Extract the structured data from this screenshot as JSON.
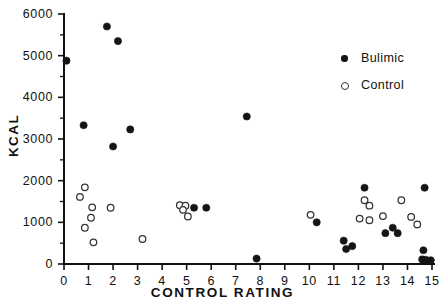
{
  "chart_data": {
    "type": "scatter",
    "title": "",
    "xlabel": "CONTROL RATING",
    "ylabel": "KCAL",
    "xlim": [
      0,
      15
    ],
    "ylim": [
      0,
      6000
    ],
    "grid": false,
    "legend_position": "top-right",
    "x_ticks": [
      0,
      1,
      2,
      3,
      4,
      5,
      6,
      7,
      8,
      9,
      10,
      11,
      12,
      13,
      14,
      15
    ],
    "x_tick_labels": [
      "0",
      "1",
      "2",
      "3",
      "4",
      "5",
      "6",
      "7",
      "8",
      "9",
      "10",
      "11",
      "12",
      "13",
      "14",
      "15"
    ],
    "y_ticks": [
      0,
      1000,
      2000,
      3000,
      4000,
      5000,
      6000
    ],
    "y_tick_labels": [
      "0",
      "1000",
      "2000",
      "3000",
      "4000",
      "5000",
      "6000"
    ],
    "y_minor_ticks": [
      500,
      1500,
      2500,
      3500,
      4500,
      5500
    ],
    "series": [
      {
        "name": "Bulimic",
        "marker": "filled-circle",
        "color": "#151515",
        "points": [
          [
            0.1,
            4880
          ],
          [
            0.8,
            3330
          ],
          [
            1.75,
            5700
          ],
          [
            2.2,
            5350
          ],
          [
            2.0,
            2820
          ],
          [
            2.7,
            3230
          ],
          [
            5.3,
            1350
          ],
          [
            5.8,
            1350
          ],
          [
            7.45,
            3540
          ],
          [
            7.85,
            130
          ],
          [
            10.3,
            1000
          ],
          [
            11.4,
            560
          ],
          [
            11.5,
            360
          ],
          [
            11.75,
            430
          ],
          [
            12.25,
            1830
          ],
          [
            13.1,
            740
          ],
          [
            13.4,
            870
          ],
          [
            13.6,
            740
          ],
          [
            14.7,
            1830
          ],
          [
            14.65,
            330
          ],
          [
            14.6,
            110
          ],
          [
            14.75,
            100
          ],
          [
            14.95,
            90
          ]
        ]
      },
      {
        "name": "Control",
        "marker": "open-circle",
        "color": "#333333",
        "points": [
          [
            0.85,
            1840
          ],
          [
            0.65,
            1610
          ],
          [
            1.15,
            1360
          ],
          [
            1.1,
            1110
          ],
          [
            0.85,
            870
          ],
          [
            1.2,
            520
          ],
          [
            1.9,
            1350
          ],
          [
            3.2,
            600
          ],
          [
            4.72,
            1410
          ],
          [
            4.95,
            1400
          ],
          [
            4.85,
            1300
          ],
          [
            5.05,
            1140
          ],
          [
            10.05,
            1180
          ],
          [
            12.25,
            1530
          ],
          [
            12.45,
            1400
          ],
          [
            12.05,
            1090
          ],
          [
            12.45,
            1050
          ],
          [
            13.0,
            1150
          ],
          [
            13.75,
            1530
          ],
          [
            14.15,
            1130
          ],
          [
            14.4,
            950
          ]
        ]
      }
    ]
  },
  "legend": {
    "entries": [
      {
        "label": "Bulimic",
        "marker": "filled-circle"
      },
      {
        "label": "Control",
        "marker": "open-circle"
      }
    ]
  }
}
